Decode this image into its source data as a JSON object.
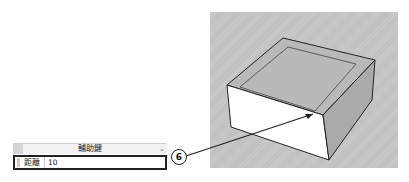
{
  "panel": {
    "dropdown_label": "輔助鍵",
    "field_label": "距離",
    "field_value": "10"
  },
  "callout": {
    "number": "6"
  },
  "viewport": {
    "object": "box-with-inset-offset"
  },
  "colors": {
    "viewport_bg": "#c6c6c6",
    "box_top": "#b8b8b8",
    "box_front": "#ffffff",
    "box_side": "#a9a9a9",
    "outline": "#222222"
  }
}
